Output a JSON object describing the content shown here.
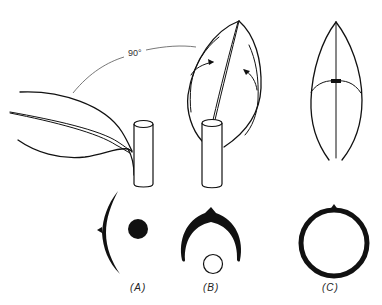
{
  "diagram": {
    "angle_label": "90°",
    "panels": [
      {
        "id": "A",
        "label": "(A)",
        "description": "leaf held horizontally, 90° from vertical; cross-section shows lamina arc beside petiole/stem dot"
      },
      {
        "id": "B",
        "label": "(B)",
        "description": "leaf raised vertically with margins curling inward; cross-section horseshoe above stem"
      },
      {
        "id": "C",
        "label": "(C)",
        "description": "leaf margins meeting; cross-section closed ring"
      }
    ],
    "colors": {
      "stroke": "#111111",
      "background": "#ffffff"
    }
  }
}
